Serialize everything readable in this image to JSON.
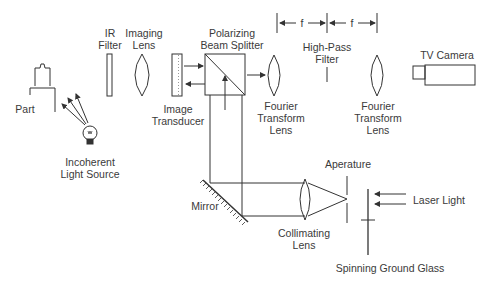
{
  "diagram": {
    "type": "optical-system-schematic",
    "components": {
      "part": "Part",
      "light_source": [
        "Incoherent",
        "Light Source"
      ],
      "ir_filter": [
        "IR",
        "Filter"
      ],
      "imaging_lens": [
        "Imaging",
        "Lens"
      ],
      "image_transducer": [
        "Image",
        "Transducer"
      ],
      "beam_splitter": [
        "Polarizing",
        "Beam Splitter"
      ],
      "fourier_lens_1": [
        "Fourier",
        "Transform",
        "Lens"
      ],
      "high_pass_filter": [
        "High-Pass",
        "Filter"
      ],
      "fourier_lens_2": [
        "Fourier",
        "Transform",
        "Lens"
      ],
      "tv_camera": "TV Camera",
      "mirror": "Mirror",
      "collimating_lens": [
        "Collimating",
        "Lens"
      ],
      "aperture": "Aperature",
      "laser": "Laser Light",
      "ground_glass": "Spinning Ground Glass"
    },
    "dimensions": {
      "focal_1": "f",
      "focal_2": "f"
    }
  }
}
